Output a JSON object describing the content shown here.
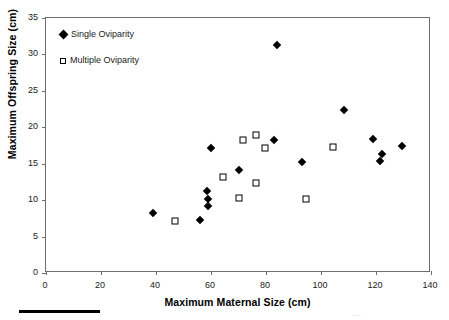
{
  "chart_data": {
    "type": "scatter",
    "title": "",
    "xlabel": "Maximum Maternal Size (cm)",
    "ylabel": "Maximum Offspring Size (cm)",
    "xlim": [
      0,
      140
    ],
    "ylim": [
      0,
      35
    ],
    "xticks": [
      0,
      20,
      40,
      60,
      80,
      100,
      120,
      140
    ],
    "yticks": [
      0,
      5,
      10,
      15,
      20,
      25,
      30,
      35
    ],
    "grid": false,
    "legend_position": "top-left",
    "series": [
      {
        "name": "Single Oviparity",
        "marker": "filled-diamond",
        "color": "#000000",
        "points": [
          [
            39.0,
            8.2
          ],
          [
            56.0,
            7.3
          ],
          [
            59.0,
            9.2
          ],
          [
            59.0,
            10.2
          ],
          [
            58.5,
            11.2
          ],
          [
            60.0,
            17.2
          ],
          [
            70.0,
            14.2
          ],
          [
            84.0,
            31.3
          ],
          [
            83.0,
            18.3
          ],
          [
            93.0,
            15.2
          ],
          [
            108.5,
            22.4
          ],
          [
            119.0,
            18.4
          ],
          [
            122.0,
            16.4
          ],
          [
            121.5,
            15.4
          ],
          [
            129.5,
            17.4
          ]
        ]
      },
      {
        "name": "Multiple Oviparity",
        "marker": "open-square",
        "color": "#000000",
        "points": [
          [
            47.0,
            7.2
          ],
          [
            64.5,
            13.2
          ],
          [
            70.0,
            10.3
          ],
          [
            71.5,
            18.3
          ],
          [
            76.5,
            19.0
          ],
          [
            76.5,
            12.4
          ],
          [
            79.5,
            17.2
          ],
          [
            94.5,
            10.1
          ],
          [
            104.5,
            17.3
          ]
        ]
      }
    ]
  },
  "legend": {
    "items": [
      {
        "label": "Single Oviparity",
        "marker": "filled-diamond"
      },
      {
        "label": "Multiple Oviparity",
        "marker": "open-square"
      }
    ]
  },
  "artifacts": {
    "scan_text": "...."
  }
}
